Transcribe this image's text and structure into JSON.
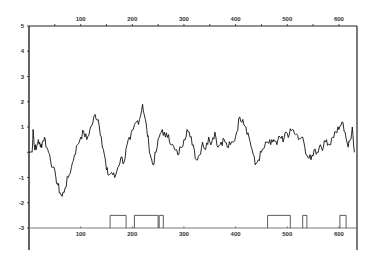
{
  "chart_data": {
    "type": "line",
    "title": "",
    "xlabel": "",
    "ylabel": "",
    "xlim": [
      0,
      640
    ],
    "ylim": [
      -3,
      5
    ],
    "x_ticks": [
      100,
      200,
      300,
      400,
      500,
      600
    ],
    "x_tick_labels_top": [
      "100",
      "200",
      "300",
      "400",
      "500",
      "600"
    ],
    "x_tick_labels_bottom": [
      "100",
      "200",
      "300",
      "400",
      "500",
      "600"
    ],
    "y_ticks": [
      5,
      4,
      3,
      2,
      1,
      0,
      -1,
      -2,
      -3
    ],
    "y_tick_labels": [
      "5",
      "4",
      "3",
      "2",
      "1",
      "",
      "-1",
      "-2",
      "-3"
    ],
    "grid": false,
    "legend": null,
    "series": [
      {
        "name": "profile",
        "x": [
          0,
          6,
          8,
          10,
          14,
          18,
          22,
          26,
          30,
          34,
          40,
          46,
          52,
          56,
          60,
          64,
          70,
          76,
          82,
          88,
          94,
          100,
          106,
          112,
          118,
          124,
          128,
          134,
          140,
          146,
          150,
          154,
          160,
          166,
          172,
          178,
          184,
          190,
          196,
          202,
          208,
          214,
          220,
          224,
          228,
          232,
          236,
          240,
          246,
          252,
          258,
          264,
          270,
          276,
          282,
          288,
          294,
          300,
          306,
          312,
          318,
          324,
          330,
          336,
          342,
          348,
          354,
          360,
          366,
          372,
          378,
          384,
          390,
          396,
          402,
          408,
          414,
          420,
          426,
          432,
          438,
          444,
          450,
          456,
          462,
          468,
          474,
          480,
          486,
          492,
          498,
          504,
          510,
          516,
          522,
          528,
          534,
          540,
          546,
          552,
          558,
          564,
          570,
          576,
          582,
          588,
          594,
          600,
          606,
          612,
          618,
          622,
          626,
          630
        ],
        "values": [
          0.0,
          0.0,
          0.9,
          0.3,
          0.1,
          0.5,
          0.2,
          0.4,
          0.6,
          0.2,
          -0.1,
          -0.6,
          -1.0,
          -1.3,
          -1.6,
          -1.75,
          -1.4,
          -1.0,
          -0.6,
          -0.1,
          0.3,
          0.6,
          0.8,
          0.5,
          0.9,
          1.2,
          1.5,
          1.3,
          0.6,
          -0.1,
          -0.7,
          -0.9,
          -0.8,
          -1.0,
          -0.6,
          -0.2,
          -0.4,
          0.3,
          0.5,
          0.9,
          1.2,
          1.3,
          1.9,
          1.4,
          0.9,
          0.3,
          -0.2,
          -0.5,
          0.0,
          0.6,
          0.9,
          0.6,
          0.7,
          0.3,
          0.1,
          -0.1,
          0.2,
          0.5,
          0.9,
          0.6,
          0.3,
          -0.3,
          -0.1,
          0.4,
          0.1,
          0.6,
          0.4,
          0.8,
          0.2,
          0.4,
          0.5,
          0.2,
          0.3,
          0.4,
          0.8,
          1.4,
          1.3,
          1.0,
          0.6,
          0.1,
          -0.5,
          -0.3,
          0.0,
          0.2,
          0.4,
          0.3,
          0.5,
          0.3,
          0.6,
          0.4,
          0.8,
          0.7,
          0.9,
          0.7,
          0.5,
          0.6,
          0.2,
          -0.2,
          -0.3,
          0.1,
          0.0,
          0.3,
          0.2,
          0.5,
          0.3,
          0.6,
          0.8,
          0.9,
          1.2,
          0.8,
          0.2,
          0.5,
          1.0,
          0.0
        ]
      },
      {
        "name": "segments",
        "baseline": -3,
        "pulse_height": 0.5,
        "intervals": [
          [
            157,
            188
          ],
          [
            204,
            250
          ],
          [
            252,
            260
          ],
          [
            462,
            506
          ],
          [
            530,
            538
          ],
          [
            602,
            614
          ]
        ]
      }
    ]
  }
}
